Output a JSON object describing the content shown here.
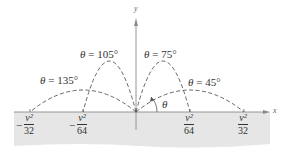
{
  "diagram": {
    "type": "projectile-trajectories",
    "axes": {
      "x_label": "x",
      "y_label": "y"
    },
    "trajectories": [
      {
        "angle_label": "θ = 135°",
        "symbol": "θ",
        "equals": "=",
        "value": "135°"
      },
      {
        "angle_label": "θ = 105°",
        "symbol": "θ",
        "equals": "=",
        "value": "105°"
      },
      {
        "angle_label": "θ = 75°",
        "symbol": "θ",
        "equals": "=",
        "value": "75°"
      },
      {
        "angle_label": "θ = 45°",
        "symbol": "θ",
        "equals": "=",
        "value": "45°"
      }
    ],
    "angle_marker": "θ",
    "x_ticks": [
      {
        "sign": "−",
        "numerator": "v²",
        "denominator": "32"
      },
      {
        "sign": "−",
        "numerator": "v²",
        "denominator": "64"
      },
      {
        "sign": "",
        "numerator": "v²",
        "denominator": "64"
      },
      {
        "sign": "",
        "numerator": "v²",
        "denominator": "32"
      }
    ],
    "colors": {
      "ground": "#e6e6e6",
      "curve": "#555555",
      "axis": "#8a8a8a",
      "text": "#333333"
    }
  }
}
